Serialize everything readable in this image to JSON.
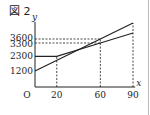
{
  "figure": {
    "label": "図 2"
  },
  "chart_data": {
    "type": "line",
    "title": "図 2",
    "xlabel": "x",
    "ylabel": "y",
    "origin_label": "O",
    "x_ticks": [
      "20",
      "60",
      "90"
    ],
    "y_ticks": [
      "1200",
      "2300",
      "3300",
      "3600"
    ],
    "xlim": [
      0,
      90
    ],
    "ylim": [
      0,
      4800
    ],
    "grid": false,
    "series": [
      {
        "name": "line A",
        "x": [
          0,
          60,
          90
        ],
        "y": [
          1200,
          3600,
          4800
        ]
      },
      {
        "name": "line B",
        "x": [
          0,
          20,
          60,
          90
        ],
        "y": [
          2300,
          2300,
          3300,
          4050
        ]
      }
    ],
    "guides": [
      {
        "type": "dashed",
        "from": [
          0,
          3600
        ],
        "to": [
          60,
          3600
        ]
      },
      {
        "type": "dashed",
        "from": [
          0,
          3300
        ],
        "to": [
          60,
          3300
        ]
      },
      {
        "type": "dashed",
        "from": [
          20,
          0
        ],
        "to": [
          20,
          2300
        ]
      },
      {
        "type": "dashed",
        "from": [
          60,
          0
        ],
        "to": [
          60,
          3600
        ]
      },
      {
        "type": "dashed",
        "from": [
          90,
          0
        ],
        "to": [
          90,
          4800
        ]
      }
    ]
  }
}
